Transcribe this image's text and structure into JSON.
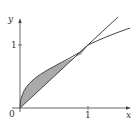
{
  "diagram": {
    "type": "area-between-curves",
    "curves": [
      {
        "name": "upper",
        "expression": "y = sqrt(x)"
      },
      {
        "name": "lower",
        "expression": "y = x"
      }
    ],
    "shaded_region": {
      "from_x": 0,
      "to_x": 1,
      "fill": "#aaaaaa"
    },
    "intersection_points": [
      [
        0,
        0
      ],
      [
        1,
        1
      ]
    ]
  },
  "axes": {
    "x_label": "x",
    "y_label": "y",
    "origin_label": "0",
    "x_tick_label": "1",
    "y_tick_label": "1"
  },
  "colors": {
    "axis": "#555555",
    "curve": "#444444",
    "shade": "#aaaaaa",
    "background": "#ffffff"
  }
}
